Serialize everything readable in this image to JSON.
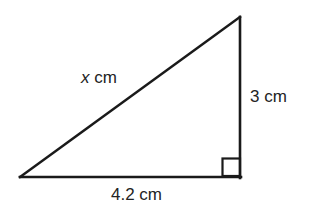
{
  "figure": {
    "type": "right-triangle-diagram",
    "background_color": "#ffffff",
    "stroke_color": "#1a1a1a",
    "text_color": "#232323",
    "vertices": {
      "left": [
        20,
        177
      ],
      "apex": [
        240,
        17
      ],
      "right_angle": [
        240,
        177
      ]
    },
    "right_angle_marker": {
      "present": true,
      "at_vertex": "right_angle",
      "size_px": 18
    },
    "sides": {
      "hypotenuse_label": "x cm",
      "hypotenuse_variable": "x",
      "hypotenuse_unit": "cm",
      "vertical_label": "3 cm",
      "vertical_value": "3",
      "vertical_unit": "cm",
      "base_label": "4.2 cm",
      "base_value": "4.2",
      "base_unit": "cm"
    }
  }
}
